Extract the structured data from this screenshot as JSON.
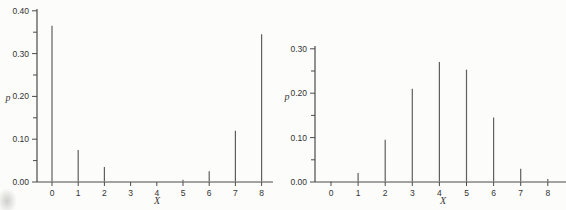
{
  "figure": {
    "panel_count": 2
  },
  "colors": {
    "background": "#fcfcfa",
    "axis": "#4a4a4a",
    "stem": "#5f5f5f",
    "text": "#333333"
  },
  "chart_data": [
    {
      "type": "stem",
      "title": "",
      "xlabel": "X",
      "ylabel": "p",
      "x": [
        0,
        1,
        2,
        3,
        4,
        5,
        6,
        7,
        8
      ],
      "y": [
        0.365,
        0.075,
        0.035,
        0,
        0,
        0.005,
        0.025,
        0.12,
        0.345
      ],
      "ylim": [
        0,
        0.4
      ],
      "ytick_step": 0.1,
      "yminor_step": 0.05,
      "ytick_labels": [
        "0.00",
        "0.10",
        "0.20",
        "0.30",
        "0.40"
      ],
      "xtick_labels": [
        "0",
        "1",
        "2",
        "3",
        "4",
        "5",
        "6",
        "7",
        "8"
      ],
      "grid": "off",
      "legend": "none"
    },
    {
      "type": "stem",
      "title": "",
      "xlabel": "X",
      "ylabel": "p",
      "x": [
        0,
        1,
        2,
        3,
        4,
        5,
        6,
        7,
        8
      ],
      "y": [
        0.002,
        0.02,
        0.095,
        0.21,
        0.27,
        0.253,
        0.145,
        0.03,
        0.007
      ],
      "ylim": [
        0,
        0.3
      ],
      "ytick_step": 0.1,
      "yminor_step": 0.05,
      "ytick_labels": [
        "0.00",
        "0.10",
        "0.20",
        "0.30"
      ],
      "xtick_labels": [
        "0",
        "1",
        "2",
        "3",
        "4",
        "5",
        "6",
        "7",
        "8"
      ],
      "grid": "off",
      "legend": "none"
    }
  ]
}
